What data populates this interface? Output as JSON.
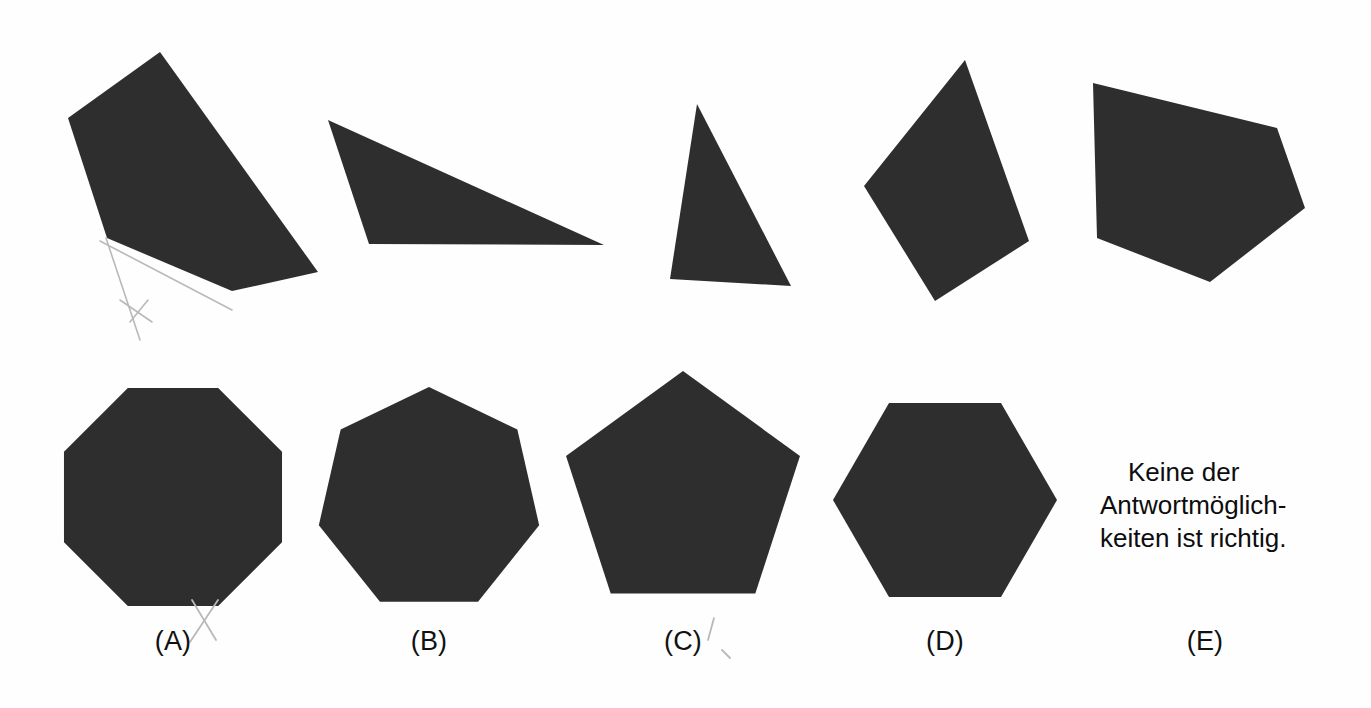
{
  "page": {
    "background_color": "#fefefe",
    "shape_fill_color": "#2e2e2e",
    "pencil_mark_color": "#b9b9b9",
    "width": 1371,
    "height": 708
  },
  "prompt_row": {
    "name": "question-shapes-row",
    "shapes": [
      {
        "id": "prompt-shape-1",
        "kind": "quadrilateral",
        "points": "160,52 68,118 107,238 232,291 318,272"
      },
      {
        "id": "prompt-shape-2",
        "kind": "triangle",
        "points": "328,120 369,244 604,245"
      },
      {
        "id": "prompt-shape-3",
        "kind": "triangle",
        "points": "697,104 670,279 791,286"
      },
      {
        "id": "prompt-shape-4",
        "kind": "quadrilateral",
        "points": "965,60 864,186 935,301 1029,241"
      },
      {
        "id": "prompt-shape-5",
        "kind": "pentagon",
        "points": "1093,83 1277,128 1305,208 1210,282 1097,238"
      }
    ],
    "pencil_marks": [
      {
        "id": "pencil-line-1",
        "d": "M 106 238 L 140 340"
      },
      {
        "id": "pencil-line-2",
        "d": "M 100 241 L 232 310"
      },
      {
        "id": "pencil-line-3",
        "d": "M 120 300 L 152 322"
      },
      {
        "id": "pencil-line-4",
        "d": "M 130 322 L 148 300"
      }
    ]
  },
  "answer_row": {
    "name": "answer-options-row",
    "options": [
      {
        "key": "A",
        "label": "(A)",
        "shape": "octagon",
        "cx": 173,
        "cy": 497,
        "r": 118,
        "rotation": 22.5,
        "label_x": 173,
        "label_y": 626
      },
      {
        "key": "B",
        "label": "(B)",
        "shape": "heptagon",
        "cx": 429,
        "cy": 500,
        "r": 113,
        "rotation": 0,
        "label_x": 429,
        "label_y": 626
      },
      {
        "key": "C",
        "label": "(C)",
        "shape": "pentagon",
        "cx": 683,
        "cy": 494,
        "r": 123,
        "rotation": 0,
        "label_x": 683,
        "label_y": 626
      },
      {
        "key": "D",
        "label": "(D)",
        "shape": "hexagon",
        "cx": 945,
        "cy": 500,
        "r": 112,
        "rotation": 30,
        "label_x": 945,
        "label_y": 626
      },
      {
        "key": "E",
        "label": "(E)",
        "shape": "none",
        "cx": 1205,
        "cy": 500,
        "r": 0,
        "rotation": 0,
        "label_x": 1205,
        "label_y": 626
      }
    ],
    "none_of_the_above": {
      "line1": "Keine der",
      "line2": "Antwortmöglich-",
      "line3": "keiten ist richtig."
    },
    "pencil_marks": [
      {
        "id": "pencil-cross-a-1",
        "d": "M 192 600 L 216 640"
      },
      {
        "id": "pencil-cross-a-2",
        "d": "M 218 600 L 190 642"
      },
      {
        "id": "pencil-tick-c-1",
        "d": "M 714 618 L 708 640"
      },
      {
        "id": "pencil-tick-c-2",
        "d": "M 722 650 L 730 658"
      }
    ]
  }
}
